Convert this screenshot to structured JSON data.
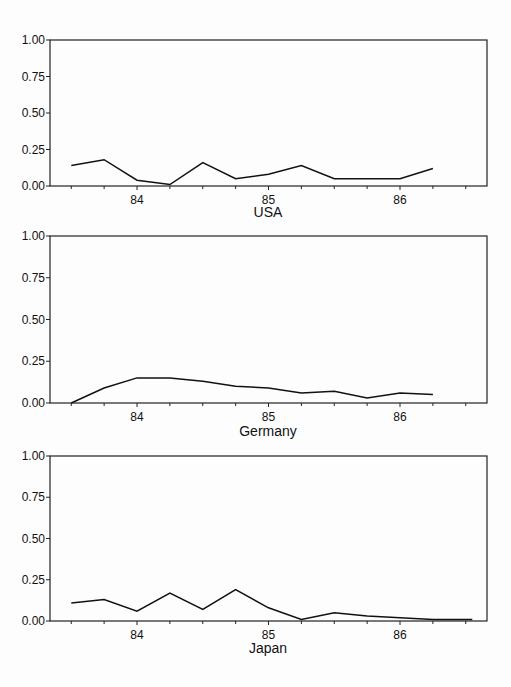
{
  "chart_data": [
    {
      "type": "line",
      "title": "USA",
      "xlabel": "USA",
      "ylabel": "",
      "ylim": [
        0,
        1
      ],
      "yticks": [
        "0.00",
        "0.25",
        "0.50",
        "0.75",
        "1.00"
      ],
      "xticks": [
        "84",
        "85",
        "86"
      ],
      "grid": false,
      "x": [
        83.5,
        83.75,
        84.0,
        84.25,
        84.5,
        84.75,
        85.0,
        85.25,
        85.5,
        85.75,
        86.0,
        86.25
      ],
      "series": [
        {
          "name": "USA",
          "values": [
            0.14,
            0.18,
            0.04,
            0.01,
            0.16,
            0.05,
            0.08,
            0.14,
            0.05,
            0.05,
            0.05,
            0.12
          ]
        }
      ]
    },
    {
      "type": "line",
      "title": "Germany",
      "xlabel": "Germany",
      "ylabel": "",
      "ylim": [
        0,
        1
      ],
      "yticks": [
        "0.00",
        "0.25",
        "0.50",
        "0.75",
        "1.00"
      ],
      "xticks": [
        "84",
        "85",
        "86"
      ],
      "grid": false,
      "x": [
        83.5,
        83.75,
        84.0,
        84.25,
        84.5,
        84.75,
        85.0,
        85.25,
        85.5,
        85.75,
        86.0,
        86.25
      ],
      "series": [
        {
          "name": "Germany",
          "values": [
            0.0,
            0.09,
            0.15,
            0.15,
            0.13,
            0.1,
            0.09,
            0.06,
            0.07,
            0.03,
            0.06,
            0.05
          ]
        }
      ]
    },
    {
      "type": "line",
      "title": "Japan",
      "xlabel": "Japan",
      "ylabel": "",
      "ylim": [
        0,
        1
      ],
      "yticks": [
        "0.00",
        "0.25",
        "0.50",
        "0.75",
        "1.00"
      ],
      "xticks": [
        "84",
        "85",
        "86"
      ],
      "grid": false,
      "x": [
        83.5,
        83.75,
        84.0,
        84.25,
        84.5,
        84.75,
        85.0,
        85.25,
        85.5,
        85.75,
        86.0,
        86.25,
        86.55
      ],
      "series": [
        {
          "name": "Japan",
          "values": [
            0.11,
            0.13,
            0.06,
            0.17,
            0.07,
            0.19,
            0.08,
            0.01,
            0.05,
            0.03,
            0.02,
            0.01,
            0.01
          ]
        }
      ]
    }
  ],
  "panels": [
    {
      "title": "USA",
      "yticks": [
        "1.00",
        "0.75",
        "0.50",
        "0.25",
        "0.00"
      ],
      "xticks": [
        "84",
        "85",
        "86"
      ]
    },
    {
      "title": "Germany",
      "yticks": [
        "1.00",
        "0.75",
        "0.50",
        "0.25",
        "0.00"
      ],
      "xticks": [
        "84",
        "85",
        "86"
      ]
    },
    {
      "title": "Japan",
      "yticks": [
        "1.00",
        "0.75",
        "0.50",
        "0.25",
        "0.00"
      ],
      "xticks": [
        "84",
        "85",
        "86"
      ]
    }
  ]
}
